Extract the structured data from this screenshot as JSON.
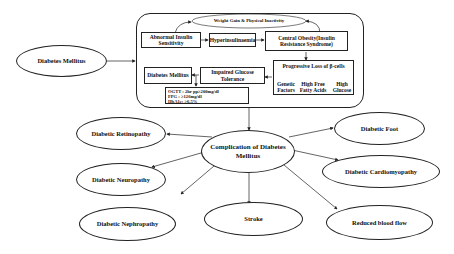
{
  "diagram": {
    "source_node": {
      "label": "Diabetes Mellitus"
    },
    "pathway": {
      "weight_gain": "Weight Gain & Physical Inactivity",
      "abnormal_insulin": "Abnormal Insulin Sensitivity",
      "hyperinsulinaemia": "Hyperinsulinaemia",
      "central_obesity": "Central Obesity(Insulin Resistance Syndrome)",
      "beta_cell_loss": "Progressive Loss of β-cells",
      "beta_causes": [
        "Genetic Factors",
        "High Free Fatty Acids",
        "High Glucose"
      ],
      "impaired_glucose": "Impaired Glucose Tolerance",
      "diabetes_mellitus_box": "Diabetes Mellitus",
      "diagnostic_criteria": [
        "OGTT  : 2hr pp≥200mg/dl",
        "FPG    : ≥126mg/dl",
        "HbA1c: ≥6.5%"
      ]
    },
    "central_node": {
      "label": "Complication of Diabetes Mellitus"
    },
    "complications": [
      "Diabetic Retinopathy",
      "Diabetic Neuropathy",
      "Diabetic Nephropathy",
      "Stroke",
      "Reduced blood flow",
      "Diabetic Cardiomyopathy",
      "Diabetic Foot"
    ],
    "colors": {
      "line": "#222222",
      "background": "#ffffff",
      "text": "#111111"
    }
  }
}
